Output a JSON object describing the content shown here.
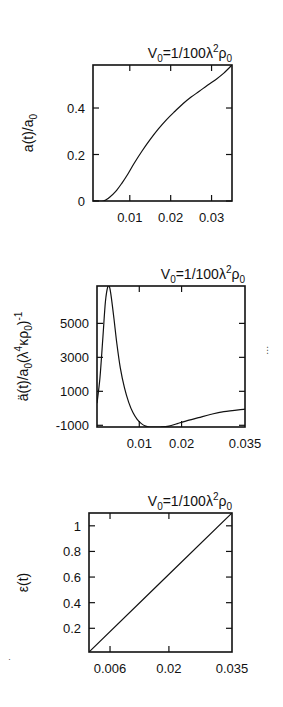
{
  "chart_data": [
    {
      "type": "line",
      "title": "V0=1/100λ²ρ0",
      "title_parts": {
        "base": "V",
        "sub1": "0",
        "mid": "=1/100λ",
        "sup": "2",
        "rho": "ρ",
        "sub2": "0"
      },
      "xlabel": "",
      "ylabel": "a(t)/a0",
      "ylabel_parts": {
        "base": "a(t)/a",
        "sub": "0"
      },
      "xlim": [
        0.001,
        0.035
      ],
      "ylim": [
        0,
        0.585
      ],
      "xticks": [
        0.01,
        0.02,
        0.03
      ],
      "xtick_labels": [
        "0.01",
        "0.02",
        "0.03"
      ],
      "yticks": [
        0,
        0.2,
        0.4
      ],
      "ytick_labels": [
        "0",
        "0.2",
        "0.4"
      ],
      "grid": false,
      "legend": null,
      "box": {
        "left": 93,
        "top": 65,
        "right": 232,
        "bottom": 201
      },
      "series": [
        {
          "name": "a(t)/a0",
          "x": [
            0.001,
            0.0035,
            0.005,
            0.0065,
            0.008,
            0.0095,
            0.011,
            0.013,
            0.015,
            0.017,
            0.019,
            0.021,
            0.023,
            0.025,
            0.027,
            0.029,
            0.031,
            0.033,
            0.035
          ],
          "y": [
            0.0,
            0.0,
            0.015,
            0.04,
            0.075,
            0.115,
            0.16,
            0.215,
            0.265,
            0.31,
            0.35,
            0.385,
            0.418,
            0.447,
            0.472,
            0.498,
            0.522,
            0.55,
            0.585
          ]
        }
      ]
    },
    {
      "type": "line",
      "title": "V0=1/100λ²ρ0",
      "title_parts": {
        "base": "V",
        "sub1": "0",
        "mid": "=1/100λ",
        "sup": "2",
        "rho": "ρ",
        "sub2": "0"
      },
      "xlabel": "",
      "ylabel": "ä(t)/a0(λ⁴κρ0)⁻¹",
      "ylabel_parts": {
        "base": "ä(t)/a",
        "sub": "0",
        "mid": "(λ",
        "sup": "4",
        "mid2": "κρ",
        "sub2": "0",
        "end": ")",
        "sup2": "-1"
      },
      "xlim": [
        0.0,
        0.035
      ],
      "ylim": [
        -1100,
        7200
      ],
      "xticks": [
        0.01,
        0.02,
        0.035
      ],
      "xtick_labels": [
        "0.01",
        "0.02",
        "0.035"
      ],
      "yticks": [
        -1000,
        1000,
        3000,
        5000
      ],
      "ytick_labels": [
        "-1000",
        "1000",
        "3000",
        "5000"
      ],
      "grid": false,
      "legend": null,
      "box": {
        "left": 97,
        "top": 286,
        "right": 245,
        "bottom": 427
      },
      "series": [
        {
          "name": "ä(t)/a0",
          "x": [
            0.0,
            0.0007,
            0.0014,
            0.002,
            0.0026,
            0.003,
            0.0034,
            0.004,
            0.0047,
            0.0055,
            0.0065,
            0.0075,
            0.0085,
            0.0095,
            0.0105,
            0.0115,
            0.0125,
            0.0135,
            0.015,
            0.017,
            0.019,
            0.021,
            0.024,
            0.027,
            0.03,
            0.035
          ],
          "y": [
            300,
            1800,
            4200,
            6300,
            7200,
            7100,
            6500,
            5300,
            3800,
            2400,
            1200,
            350,
            -250,
            -650,
            -900,
            -1050,
            -1100,
            -1100,
            -1100,
            -1050,
            -900,
            -750,
            -550,
            -350,
            -200,
            -50
          ]
        }
      ]
    },
    {
      "type": "line",
      "title": "V0=1/100λ²ρ0",
      "title_parts": {
        "base": "V",
        "sub1": "0",
        "mid": "=1/100λ",
        "sup": "2",
        "rho": "ρ",
        "sub2": "0"
      },
      "xlabel": "",
      "ylabel": "ε(t)",
      "xlim": [
        0.001,
        0.035
      ],
      "ylim": [
        0.015,
        1.1
      ],
      "xticks": [
        0.006,
        0.02,
        0.035
      ],
      "xtick_labels": [
        "0.006",
        "0.02",
        "0.035"
      ],
      "yticks": [
        0.2,
        0.4,
        0.6,
        0.8,
        1.0
      ],
      "ytick_labels": [
        "0.2",
        "0.4",
        "0.6",
        "0.8",
        "1"
      ],
      "grid": false,
      "legend": null,
      "box": {
        "left": 89,
        "top": 513,
        "right": 232,
        "bottom": 652
      },
      "series": [
        {
          "name": "ε(t)",
          "x": [
            0.001,
            0.035
          ],
          "y": [
            0.015,
            1.1
          ]
        }
      ]
    }
  ],
  "stray_marks": [
    {
      "text": "⋮",
      "left": 263,
      "top": 346
    },
    {
      "text": "·",
      "left": 8,
      "top": 655
    }
  ]
}
